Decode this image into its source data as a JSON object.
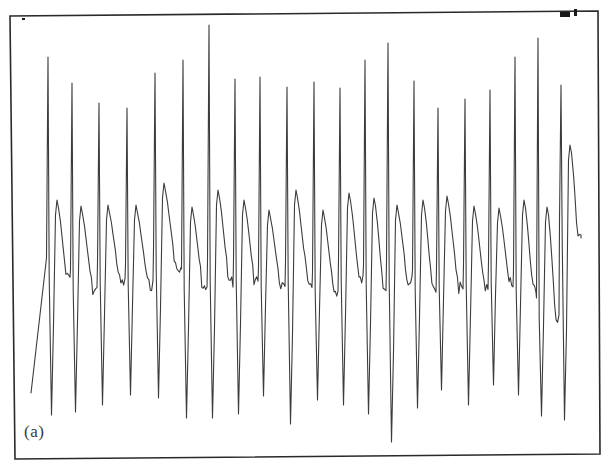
{
  "figure": {
    "panel_label": "(a)",
    "frame": {
      "top_left": [
        10,
        16
      ],
      "top_right": [
        598,
        11
      ],
      "bottom_right": [
        600,
        454
      ],
      "bottom_left": [
        15,
        459
      ]
    },
    "corner_marks": [
      {
        "name": "dot-mark",
        "x": 22,
        "y": 18,
        "w": 3,
        "h": 2
      },
      {
        "name": "bar-mark",
        "x": 560,
        "y": 12,
        "w": 10,
        "h": 5
      },
      {
        "name": "tick-mark",
        "x": 574,
        "y": 9,
        "w": 3,
        "h": 7
      }
    ],
    "trace_color": "#3c3c3c",
    "frame_color": "#2a2a2a"
  },
  "chart_data": {
    "type": "line",
    "title": "",
    "xlabel": "",
    "ylabel": "",
    "grid": false,
    "legend": null,
    "annotations": [
      "(a)"
    ],
    "start_point": [
      31,
      393
    ],
    "cycles": [
      {
        "spike_x": 48,
        "up_y": 57,
        "down_y": 415,
        "hump_y": 200,
        "base_y": 278
      },
      {
        "spike_x": 72,
        "up_y": 83,
        "down_y": 412,
        "hump_y": 206,
        "base_y": 290
      },
      {
        "spike_x": 99,
        "up_y": 103,
        "down_y": 405,
        "hump_y": 205,
        "base_y": 283
      },
      {
        "spike_x": 127,
        "up_y": 108,
        "down_y": 395,
        "hump_y": 205,
        "base_y": 285
      },
      {
        "spike_x": 155,
        "up_y": 73,
        "down_y": 398,
        "hump_y": 183,
        "base_y": 270
      },
      {
        "spike_x": 183,
        "up_y": 60,
        "down_y": 418,
        "hump_y": 207,
        "base_y": 289
      },
      {
        "spike_x": 209,
        "up_y": 25,
        "down_y": 418,
        "hump_y": 190,
        "base_y": 282
      },
      {
        "spike_x": 235,
        "up_y": 79,
        "down_y": 414,
        "hump_y": 200,
        "base_y": 280
      },
      {
        "spike_x": 260,
        "up_y": 77,
        "down_y": 396,
        "hump_y": 210,
        "base_y": 287
      },
      {
        "spike_x": 287,
        "up_y": 87,
        "down_y": 424,
        "hump_y": 190,
        "base_y": 282
      },
      {
        "spike_x": 314,
        "up_y": 82,
        "down_y": 400,
        "hump_y": 210,
        "base_y": 292
      },
      {
        "spike_x": 340,
        "up_y": 88,
        "down_y": 405,
        "hump_y": 193,
        "base_y": 280
      },
      {
        "spike_x": 365,
        "up_y": 60,
        "down_y": 414,
        "hump_y": 198,
        "base_y": 285
      },
      {
        "spike_x": 388,
        "up_y": 43,
        "down_y": 442,
        "hump_y": 205,
        "base_y": 282
      },
      {
        "spike_x": 414,
        "up_y": 81,
        "down_y": 408,
        "hump_y": 200,
        "base_y": 290
      },
      {
        "spike_x": 438,
        "up_y": 108,
        "down_y": 390,
        "hump_y": 196,
        "base_y": 288
      },
      {
        "spike_x": 465,
        "up_y": 99,
        "down_y": 405,
        "hump_y": 206,
        "base_y": 285
      },
      {
        "spike_x": 490,
        "up_y": 90,
        "down_y": 385,
        "hump_y": 208,
        "base_y": 282
      },
      {
        "spike_x": 515,
        "up_y": 57,
        "down_y": 395,
        "hump_y": 200,
        "base_y": 290
      },
      {
        "spike_x": 538,
        "up_y": 38,
        "down_y": 416,
        "hump_y": 207,
        "base_y": 318
      },
      {
        "spike_x": 561,
        "up_y": 85,
        "down_y": 420,
        "hump_y": 145,
        "base_y": 240
      }
    ],
    "end_point": [
      581,
      238
    ],
    "ylim_px": [
      16,
      454
    ],
    "xlim_px": [
      10,
      600
    ]
  }
}
